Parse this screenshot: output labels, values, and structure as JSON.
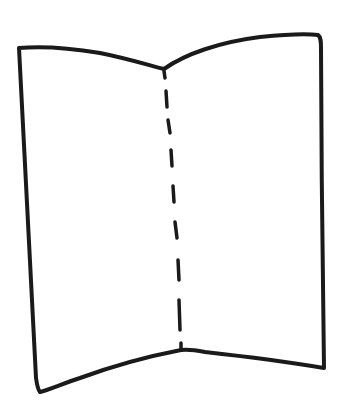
{
  "diagram": {
    "stroke_color": "#1a1a1a",
    "background_color": "#ffffff",
    "outline_points": [
      [
        19,
        48
      ],
      [
        70,
        51
      ],
      [
        164,
        69
      ],
      [
        200,
        48
      ],
      [
        260,
        36
      ],
      [
        319,
        35
      ],
      [
        321,
        45
      ],
      [
        322,
        210
      ],
      [
        324,
        368
      ],
      [
        260,
        360
      ],
      [
        185,
        349
      ],
      [
        181,
        350
      ],
      [
        120,
        364
      ],
      [
        40,
        392
      ],
      [
        36,
        383
      ],
      [
        20,
        60
      ]
    ],
    "fold_line": {
      "style": "dashed",
      "from": [
        164,
        69
      ],
      "to": [
        181,
        350
      ]
    }
  }
}
